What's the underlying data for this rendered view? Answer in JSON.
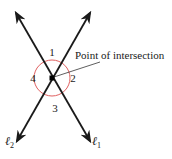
{
  "figure": {
    "angle_labels": [
      "1",
      "2",
      "3",
      "4"
    ],
    "callout": "Point of intersection",
    "line_labels": {
      "l1": {
        "letter": "ℓ",
        "subscript": "1"
      },
      "l2": {
        "letter": "ℓ",
        "subscript": "2"
      }
    },
    "colors": {
      "lines": "#1a1a1a",
      "angle_circle": "#e06060",
      "point": "#000000"
    }
  }
}
